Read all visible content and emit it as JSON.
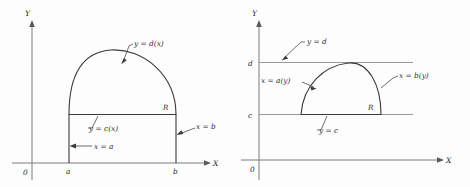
{
  "figure": {
    "background_color": "#fdfdfd",
    "ink_color": "#3a3a3a",
    "axis_color": "#7a7a7a",
    "panels": [
      {
        "id": "panel-left",
        "description": "Region R bounded above by y = d(x), below by y = c(x), between x = a and x = b",
        "axes": {
          "x_label": "X",
          "y_label": "Y",
          "origin_label": "0"
        },
        "x_ticks": [
          {
            "label": "a"
          },
          {
            "label": "b"
          }
        ],
        "y_ticks": [],
        "annotations": [
          {
            "name": "upper-curve-label",
            "text": "y = d(x)"
          },
          {
            "name": "lower-curve-label",
            "text": "y = c(x)"
          },
          {
            "name": "left-boundary-label",
            "text": "x = a"
          },
          {
            "name": "right-boundary-label",
            "text": "x = b"
          },
          {
            "name": "region-label",
            "text": "R"
          }
        ]
      },
      {
        "id": "panel-right",
        "description": "Region R bounded left by x = a(y), right by x = b(y), between y = c and y = d",
        "axes": {
          "x_label": "X",
          "y_label": "Y",
          "origin_label": "0"
        },
        "x_ticks": [],
        "y_ticks": [
          {
            "label": "d"
          },
          {
            "label": "c"
          }
        ],
        "annotations": [
          {
            "name": "upper-bound-label",
            "text": "y = d"
          },
          {
            "name": "lower-bound-label",
            "text": "y = c"
          },
          {
            "name": "left-curve-label",
            "text": "x = a(y)"
          },
          {
            "name": "right-curve-label",
            "text": "x = b(y)"
          },
          {
            "name": "region-label",
            "text": "R"
          }
        ]
      }
    ]
  }
}
